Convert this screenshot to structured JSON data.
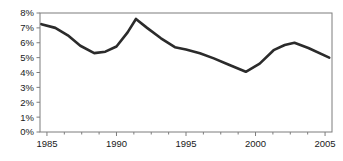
{
  "chart_data": {
    "type": "line",
    "title": "",
    "subtitle": "",
    "xlabel": "",
    "ylabel": "",
    "xlim": [
      1984.5,
      2005.5
    ],
    "ylim": [
      0,
      8
    ],
    "grid": false,
    "legend": null,
    "y_tick_labels": [
      "0%",
      "1%",
      "2%",
      "3%",
      "4%",
      "5%",
      "6%",
      "7%",
      "8%"
    ],
    "y_tick_values": [
      0,
      1,
      2,
      3,
      4,
      5,
      6,
      7,
      8
    ],
    "x_tick_labels": [
      "1985",
      "1990",
      "1995",
      "2000",
      "2005"
    ],
    "x_tick_values": [
      1985,
      1990,
      1995,
      2000,
      2005
    ],
    "x_minor_tick_values": [
      1986.25,
      1987.5,
      1988.75,
      1991.25,
      1992.5,
      1993.75,
      1996.25,
      1997.5,
      1998.75,
      2001.25,
      2002.5,
      2003.75
    ],
    "series": [
      {
        "name": "series-1",
        "color": "#2b2b2b",
        "line_width": 2.6,
        "x": [
          1984.6,
          1985.6,
          1986.5,
          1987.4,
          1988.4,
          1989.2,
          1990.0,
          1990.8,
          1991.4,
          1992.2,
          1993.2,
          1994.2,
          1995.0,
          1996.0,
          1997.0,
          1998.0,
          1999.3,
          2000.3,
          2001.3,
          2002.1,
          2002.8,
          2003.8,
          2005.3
        ],
        "values": [
          7.25,
          7.0,
          6.5,
          5.8,
          5.3,
          5.4,
          5.75,
          6.7,
          7.6,
          7.0,
          6.3,
          5.7,
          5.55,
          5.3,
          4.95,
          4.55,
          4.05,
          4.6,
          5.5,
          5.85,
          6.0,
          5.65,
          5.0
        ]
      }
    ]
  },
  "axes": {
    "frame_color": "#7d7d7d",
    "tick_color": "#7d7d7d",
    "text_color": "#1a1a1a"
  }
}
